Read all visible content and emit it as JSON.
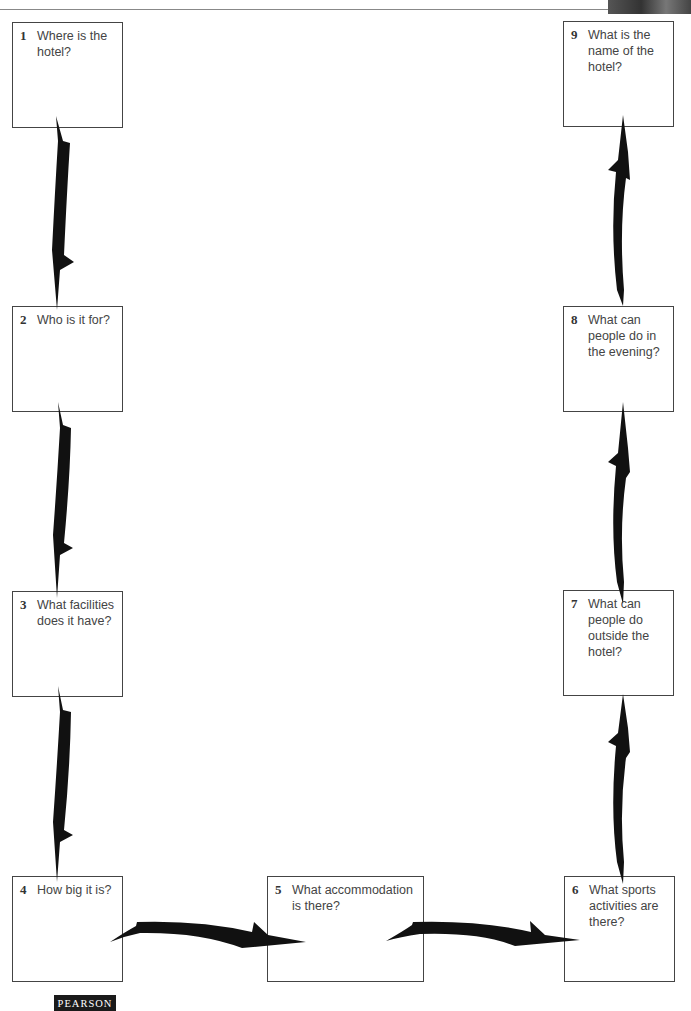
{
  "diagram": {
    "boxes": [
      {
        "num": "1",
        "question": "Where is the hotel?"
      },
      {
        "num": "2",
        "question": "Who is it for?"
      },
      {
        "num": "3",
        "question": "What facilities does it have?"
      },
      {
        "num": "4",
        "question": "How big it is?"
      },
      {
        "num": "5",
        "question": "What accommodation is there?"
      },
      {
        "num": "6",
        "question": "What sports activities are there?"
      },
      {
        "num": "7",
        "question": "What can people do outside the hotel?"
      },
      {
        "num": "8",
        "question": "What can people do in the evening?"
      },
      {
        "num": "9",
        "question": "What is the name of the hotel?"
      }
    ],
    "flow": [
      "1->2",
      "2->3",
      "3->4",
      "4->5",
      "5->6",
      "6->7",
      "7->8",
      "8->9"
    ],
    "arrow_color": "#111111",
    "border_color": "#444444"
  },
  "footer": {
    "publisher_logo": "PEARSON"
  }
}
